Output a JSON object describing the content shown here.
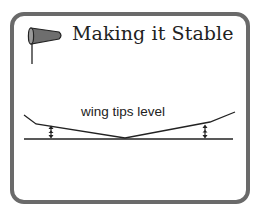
{
  "card": {
    "title": "Making it Stable",
    "title_icon": "windsock-icon",
    "border_color": "#6a6a6a"
  },
  "diagram": {
    "label": "wing tips level",
    "elements": [
      "wing-dihedral-outline",
      "ground-line",
      "left-height-arrow",
      "right-height-arrow"
    ],
    "line_color": "#222222"
  }
}
